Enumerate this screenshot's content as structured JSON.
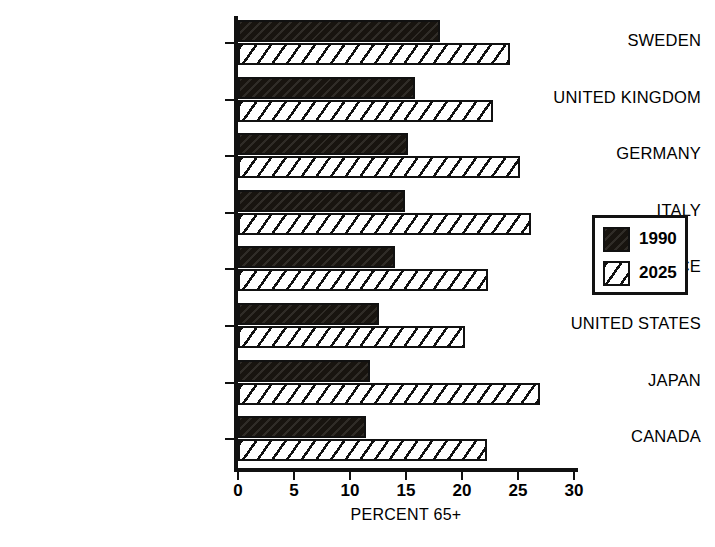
{
  "chart_data": {
    "type": "bar",
    "orientation": "horizontal",
    "title": "",
    "xlabel": "PERCENT 65+",
    "ylabel": "",
    "xlim": [
      0,
      30
    ],
    "xticks": [
      0,
      5,
      10,
      15,
      20,
      25,
      30
    ],
    "xticklabels": [
      "0",
      "5",
      "10",
      "15",
      "20",
      "25",
      "30"
    ],
    "grid": false,
    "legend_position": "right",
    "categories": [
      "SWEDEN",
      "UNITED KINGDOM",
      "GERMANY",
      "ITALY",
      "FRANCE",
      "UNITED STATES",
      "JAPAN",
      "CANADA"
    ],
    "series": [
      {
        "name": "1990",
        "fill": "solid-black",
        "color": "#18140f",
        "values": [
          18.0,
          15.8,
          15.2,
          14.9,
          14.0,
          12.6,
          11.8,
          11.4
        ]
      },
      {
        "name": "2025",
        "fill": "diagonal-hatch",
        "color": "#ffffff",
        "values": [
          24.3,
          22.8,
          25.2,
          26.2,
          22.3,
          20.3,
          27.0,
          22.2
        ]
      }
    ]
  },
  "legend": {
    "entries": [
      {
        "label": "1990",
        "swatch": "solid-black-swatch"
      },
      {
        "label": "2025",
        "swatch": "diagonal-hatch-swatch"
      }
    ]
  }
}
